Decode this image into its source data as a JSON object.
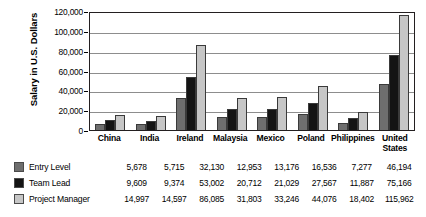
{
  "chart_data": {
    "type": "bar",
    "title": "",
    "xlabel": "",
    "ylabel": "Salary in U.S. Dollars",
    "ylim": [
      0,
      120000
    ],
    "grid": true,
    "legend_position": "bottom-left",
    "y_ticks": [
      "0",
      "20,000",
      "40,000",
      "60,000",
      "80,000",
      "100,000",
      "120,000"
    ],
    "y_tick_values": [
      0,
      20000,
      40000,
      60000,
      80000,
      100000,
      120000
    ],
    "categories": [
      "China",
      "India",
      "Ireland",
      "Malaysia",
      "Mexico",
      "Poland",
      "Philippines",
      "United States"
    ],
    "series": [
      {
        "name": "Entry Level",
        "color": "#6e6e6e",
        "values": [
          5678,
          5715,
          32130,
          12953,
          13176,
          16536,
          7277,
          46194
        ],
        "labels": [
          "5,678",
          "5,715",
          "32,130",
          "12,953",
          "13,176",
          "16,536",
          "7,277",
          "46,194"
        ]
      },
      {
        "name": "Team Lead",
        "color": "#141414",
        "values": [
          9609,
          9374,
          53002,
          20712,
          21029,
          27567,
          11887,
          75166
        ],
        "labels": [
          "9,609",
          "9,374",
          "53,002",
          "20,712",
          "21,029",
          "27,567",
          "11,887",
          "75,166"
        ]
      },
      {
        "name": "Project Manager",
        "color": "#c6c6c6",
        "values": [
          14997,
          14597,
          86085,
          31803,
          33246,
          44076,
          18402,
          115962
        ],
        "labels": [
          "14,997",
          "14,597",
          "86,085",
          "31,803",
          "33,246",
          "44,076",
          "18,402",
          "115,962"
        ]
      }
    ]
  }
}
